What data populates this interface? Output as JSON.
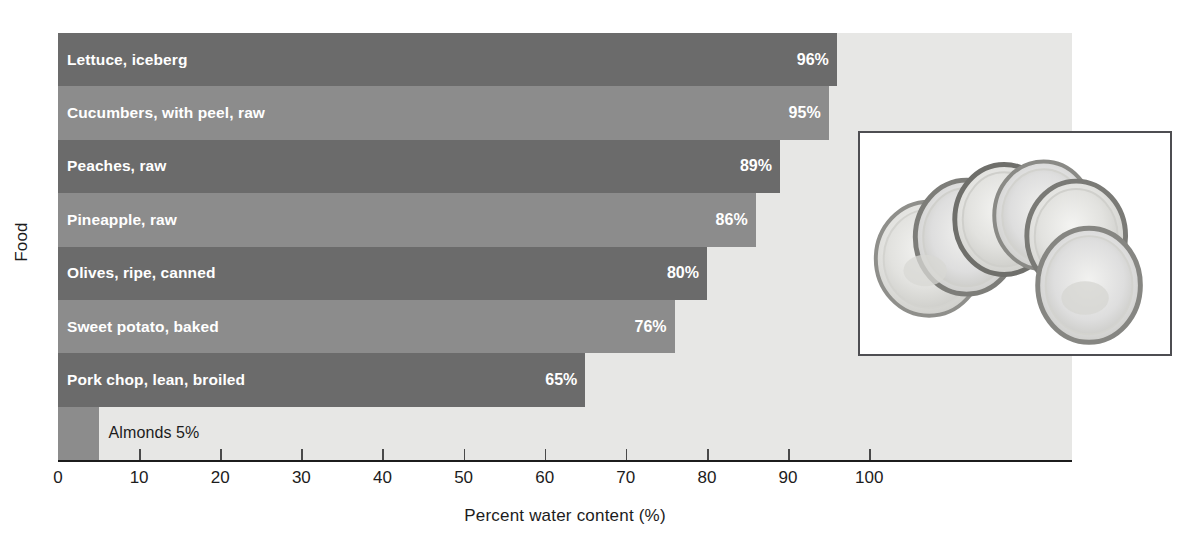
{
  "chart_data": {
    "type": "bar",
    "orientation": "horizontal",
    "title": "",
    "xlabel": "Percent water content (%)",
    "ylabel": "Food",
    "xlim": [
      0,
      125
    ],
    "xticks": [
      0,
      10,
      20,
      30,
      40,
      50,
      60,
      70,
      80,
      90,
      100
    ],
    "grid": false,
    "legend": false,
    "categories": [
      "Lettuce, iceberg",
      "Cucumbers, with peel, raw",
      "Peaches, raw",
      "Pineapple, raw",
      "Olives, ripe, canned",
      "Sweet potato, baked",
      "Pork chop, lean, broiled",
      "Almonds"
    ],
    "values": [
      96,
      95,
      89,
      86,
      80,
      76,
      65,
      5
    ],
    "value_labels": [
      "96%",
      "95%",
      "89%",
      "86%",
      "80%",
      "76%",
      "65%",
      "5%"
    ],
    "bars": [
      {
        "label": "Lettuce, iceberg",
        "value": 96,
        "value_label": "96%",
        "shade": "dark",
        "label_position": "inside",
        "value_position": "inside"
      },
      {
        "label": "Cucumbers, with peel, raw",
        "value": 95,
        "value_label": "95%",
        "shade": "light",
        "label_position": "inside",
        "value_position": "inside"
      },
      {
        "label": "Peaches, raw",
        "value": 89,
        "value_label": "89%",
        "shade": "dark",
        "label_position": "inside",
        "value_position": "inside"
      },
      {
        "label": "Pineapple, raw",
        "value": 86,
        "value_label": "86%",
        "shade": "light",
        "label_position": "inside",
        "value_position": "inside"
      },
      {
        "label": "Olives, ripe, canned",
        "value": 80,
        "value_label": "80%",
        "shade": "dark",
        "label_position": "inside",
        "value_position": "inside"
      },
      {
        "label": "Sweet potato, baked",
        "value": 76,
        "value_label": "76%",
        "shade": "light",
        "label_position": "inside",
        "value_position": "inside"
      },
      {
        "label": "Pork chop, lean, broiled",
        "value": 65,
        "value_label": "65%",
        "shade": "dark",
        "label_position": "inside",
        "value_position": "inside"
      },
      {
        "label": "Almonds 5%",
        "value": 5,
        "value_label": "",
        "shade": "light",
        "label_position": "outside",
        "value_position": "none"
      }
    ]
  },
  "colors": {
    "bar_dark": "#6b6b6b",
    "bar_light": "#8c8c8c",
    "plot_background": "#e7e7e5",
    "axis": "#1c1c1c",
    "bar_label_text": "#ffffff",
    "outside_label_text": "#1c1c1c",
    "page_background": "#ffffff",
    "inset_border": "#4e4e52"
  },
  "inset": {
    "name": "cucumber-slices-photo",
    "description": "Photograph of five overlapping cucumber slices"
  }
}
